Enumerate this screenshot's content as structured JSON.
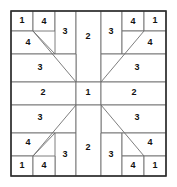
{
  "puzzle": {
    "title": "Number Grid Puzzle",
    "type": "pinwheel-region-grid",
    "symmetry": "4-fold point symmetry",
    "grid": {
      "left": 11,
      "top": 11,
      "right": 166,
      "bottom": 176,
      "width": 155,
      "height": 165
    },
    "colors": {
      "background": "#ffffff",
      "region_stroke": "#6f6f6f",
      "frame_stroke": "#2b2b2b",
      "label": "#111111"
    },
    "regions": [
      {
        "id": "tl-1",
        "value": "1",
        "points": "11,11 33,11 33,31 11,31",
        "label_x": 22,
        "label_y": 21
      },
      {
        "id": "tl-4a",
        "value": "4",
        "points": "33,11 55,11 55,31 33,31",
        "label_x": 44,
        "label_y": 22
      },
      {
        "id": "tl-4b",
        "value": "4",
        "points": "11,31 33,31 55,54 11,54",
        "label_x": 28,
        "label_y": 43
      },
      {
        "id": "t-3left",
        "value": "3",
        "points": "55,11 76,11 76,54 55,54",
        "label_x": 65,
        "label_y": 32
      },
      {
        "id": "t-2",
        "value": "2",
        "points": "76,11 101,11 101,82 76,82",
        "label_x": 88,
        "label_y": 37
      },
      {
        "id": "t-3right",
        "value": "3",
        "points": "101,11 122,11 122,54 101,54",
        "label_x": 111,
        "label_y": 32
      },
      {
        "id": "tr-4a",
        "value": "4",
        "points": "122,11 144,11 144,31 122,31",
        "label_x": 133,
        "label_y": 22
      },
      {
        "id": "tr-1",
        "value": "1",
        "points": "144,11 166,11 166,31 144,31",
        "label_x": 155,
        "label_y": 21
      },
      {
        "id": "tr-4b",
        "value": "4",
        "points": "122,31 144,31 166,31 166,54 122,54",
        "label_x": 150,
        "label_y": 43
      },
      {
        "id": "l-3upper",
        "value": "3",
        "points": "11,54 76,54 76,82 11,82",
        "label_x": 40,
        "label_y": 68
      },
      {
        "id": "r-3upper",
        "value": "3",
        "points": "101,54 166,54 166,82 101,82",
        "label_x": 137,
        "label_y": 68
      },
      {
        "id": "m-2left",
        "value": "2",
        "points": "11,82 76,82 76,105 11,105",
        "label_x": 43,
        "label_y": 93
      },
      {
        "id": "m-1",
        "value": "1",
        "points": "76,82 101,82 101,105 76,105",
        "label_x": 88,
        "label_y": 93
      },
      {
        "id": "m-2right",
        "value": "2",
        "points": "101,82 166,82 166,105 101,105",
        "label_x": 134,
        "label_y": 93
      },
      {
        "id": "l-3lower",
        "value": "3",
        "points": "11,105 76,105 76,133 11,133",
        "label_x": 40,
        "label_y": 118
      },
      {
        "id": "r-3lower",
        "value": "3",
        "points": "101,105 166,105 166,133 101,133",
        "label_x": 137,
        "label_y": 118
      },
      {
        "id": "bl-4b",
        "value": "4",
        "points": "11,133 55,133 33,156 11,156",
        "label_x": 28,
        "label_y": 143
      },
      {
        "id": "b-3left",
        "value": "3",
        "points": "55,133 76,133 76,176 55,176",
        "label_x": 65,
        "label_y": 155
      },
      {
        "id": "b-2",
        "value": "2",
        "points": "76,105 101,105 101,176 76,176",
        "label_x": 88,
        "label_y": 148
      },
      {
        "id": "b-3right",
        "value": "3",
        "points": "101,133 122,133 122,176 101,176",
        "label_x": 111,
        "label_y": 155
      },
      {
        "id": "bl-1",
        "value": "1",
        "points": "11,156 33,156 33,176 11,176",
        "label_x": 22,
        "label_y": 166
      },
      {
        "id": "bl-4a",
        "value": "4",
        "points": "33,156 55,156 55,176 33,176",
        "label_x": 44,
        "label_y": 166
      },
      {
        "id": "br-4b",
        "value": "4",
        "points": "122,133 166,133 166,156 144,156 122,156",
        "label_x": 150,
        "label_y": 143
      },
      {
        "id": "br-4a",
        "value": "4",
        "points": "122,156 144,156 144,176 122,176",
        "label_x": 133,
        "label_y": 166
      },
      {
        "id": "br-1",
        "value": "1",
        "points": "144,156 166,156 166,176 144,176",
        "label_x": 155,
        "label_y": 166
      }
    ],
    "diagonals": [
      {
        "id": "diag-top-left",
        "x1": 33,
        "y1": 31,
        "x2": 76,
        "y2": 82
      },
      {
        "id": "diag-top-right",
        "x1": 144,
        "y1": 31,
        "x2": 101,
        "y2": 82
      },
      {
        "id": "diag-bottom-left",
        "x1": 33,
        "y1": 156,
        "x2": 76,
        "y2": 105
      },
      {
        "id": "diag-bottom-right",
        "x1": 144,
        "y1": 156,
        "x2": 101,
        "y2": 105
      }
    ]
  }
}
